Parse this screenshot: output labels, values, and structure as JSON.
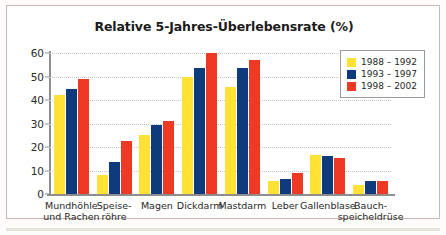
{
  "chart_data": {
    "type": "bar",
    "title": "Relative 5-Jahres-Überlebensrate (%)",
    "xlabel": "",
    "ylabel": "",
    "ylim": [
      0,
      60
    ],
    "yticks": [
      0,
      10,
      20,
      30,
      40,
      50,
      60
    ],
    "grid": true,
    "legend_position": "top-right",
    "categories": [
      "Mundhöhle und Rachen",
      "Speise- röhre",
      "Magen",
      "Dickdarm",
      "Mastdarm",
      "Leber",
      "Gallenblase",
      "Bauch- speicheldrüse"
    ],
    "category_lines": [
      [
        "Mundhöhle",
        "und Rachen"
      ],
      [
        "Speise-",
        "röhre"
      ],
      [
        "Magen",
        ""
      ],
      [
        "Dickdarm",
        ""
      ],
      [
        "Mastdarm",
        ""
      ],
      [
        "Leber",
        ""
      ],
      [
        "Gallenblase",
        ""
      ],
      [
        "Bauch-",
        "speicheldrüse"
      ]
    ],
    "series": [
      {
        "name": "1988 – 1992",
        "color": "#ffe234",
        "values": [
          42,
          8,
          25,
          50,
          45.5,
          5.5,
          16.5,
          4
        ]
      },
      {
        "name": "1993 – 1997",
        "color": "#0d3b7c",
        "values": [
          44.5,
          13.5,
          29.5,
          53.5,
          53.5,
          6.5,
          16,
          5.5
        ]
      },
      {
        "name": "1998 – 2002",
        "color": "#ee3a24",
        "values": [
          49,
          22.5,
          31,
          60,
          57,
          9,
          15.5,
          5.5
        ]
      }
    ]
  },
  "legend": {
    "items": [
      {
        "label": "1988 – 1992",
        "color": "#ffe234"
      },
      {
        "label": "1993 – 1997",
        "color": "#0d3b7c"
      },
      {
        "label": "1998 – 2002",
        "color": "#ee3a24"
      }
    ]
  }
}
